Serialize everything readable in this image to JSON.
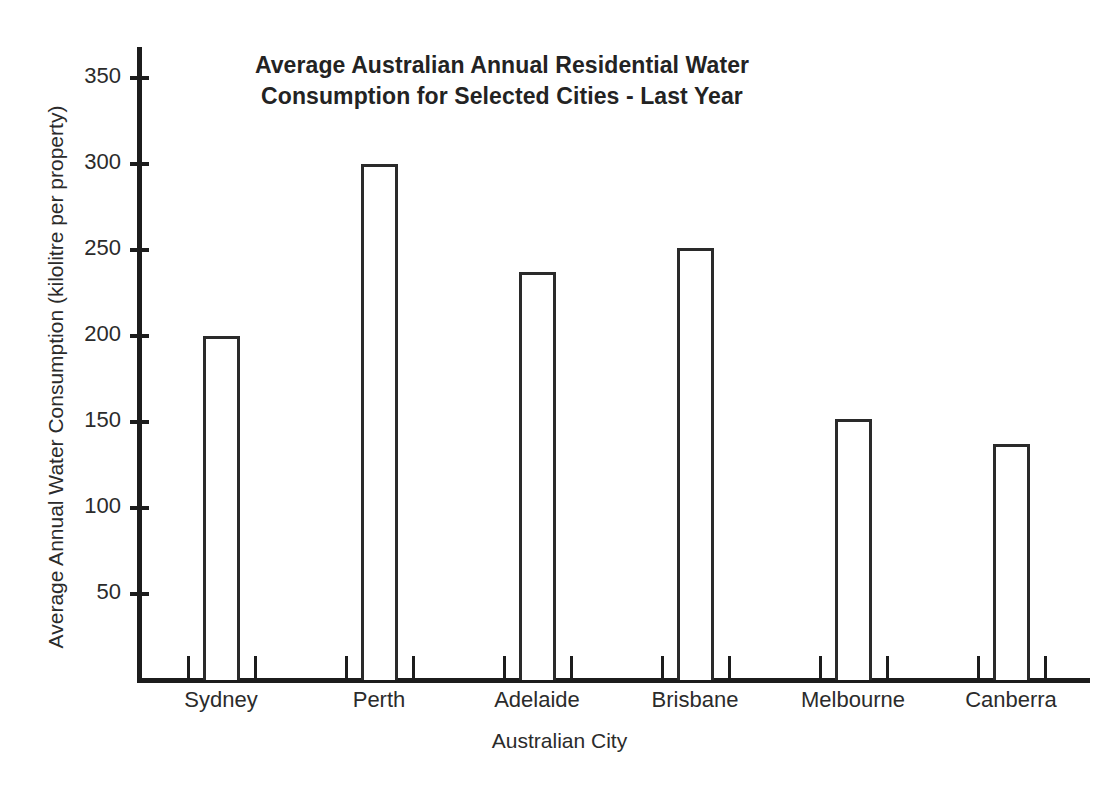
{
  "chart_data": {
    "type": "bar",
    "title": "Average Australian Annual Residential Water Consumption for Selected Cities - Last Year",
    "title_lines": [
      "Average Australian Annual Residential Water",
      "Consumption for Selected Cities - Last Year"
    ],
    "xlabel": "Australian City",
    "ylabel": "Average Annual Water Consumption (kilolitre per property)",
    "categories": [
      "Sydney",
      "Perth",
      "Adelaide",
      "Brisbane",
      "Melbourne",
      "Canberra"
    ],
    "values": [
      200,
      300,
      237,
      251,
      152,
      137
    ],
    "units": "kilolitre per property",
    "ylim": [
      0,
      368
    ],
    "yticks": [
      50,
      100,
      150,
      200,
      250,
      300,
      350
    ],
    "ytick_labels": [
      "50",
      "100",
      "150",
      "200",
      "250",
      "300",
      "350"
    ],
    "grid": false,
    "legend": null,
    "bar_style": {
      "fill": "#ffffff",
      "outline": "#2a2a2a"
    },
    "axis_color": "#1c1c1c",
    "text_color": "#2b2b2b",
    "background": "#ffffff"
  }
}
